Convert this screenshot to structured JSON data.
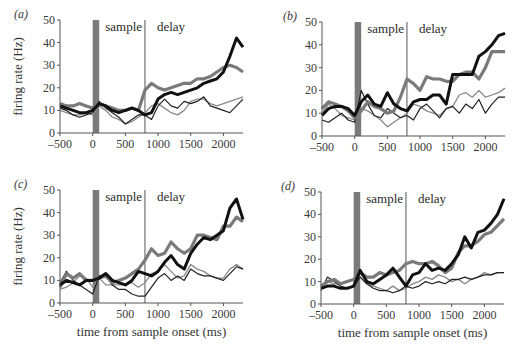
{
  "figure": {
    "ylabel": "firing rate (Hz)",
    "xlabel": "time from sample onset (ms)",
    "sample_label": "sample",
    "delay_label": "delay",
    "colors": {
      "thick_black": "#111111",
      "thick_gray": "#7a7a7a",
      "thin_black": "#222222",
      "thin_gray": "#8a8a8a",
      "sample_bar": "#7a7a7a",
      "axis": "#555555"
    }
  },
  "chart_data": [
    {
      "type": "line",
      "panel": "(a)",
      "title": "",
      "xlabel": "",
      "ylabel": "firing rate (Hz)",
      "xlim": [
        -500,
        2300
      ],
      "ylim": [
        0,
        50
      ],
      "xticks": [
        -500,
        0,
        500,
        1000,
        1500,
        2000
      ],
      "yticks": [
        0,
        10,
        20,
        30,
        40,
        50
      ],
      "grid": false,
      "annotations": [
        {
          "text": "sample",
          "type": "shaded_bar",
          "x": [
            0,
            100
          ]
        },
        {
          "text": "delay",
          "type": "vline",
          "x": 800
        }
      ],
      "x": [
        -500,
        -400,
        -300,
        -200,
        -100,
        0,
        100,
        200,
        300,
        400,
        500,
        600,
        700,
        800,
        900,
        1000,
        1100,
        1200,
        1300,
        1400,
        1500,
        1600,
        1700,
        1800,
        1900,
        2000,
        2100,
        2200,
        2300
      ],
      "series": [
        {
          "name": "thick black",
          "values": [
            12,
            11,
            10,
            9,
            9,
            10,
            13,
            12,
            10,
            9,
            10,
            11,
            10,
            8,
            9,
            15,
            17,
            18,
            17,
            18,
            19,
            20,
            22,
            23,
            24,
            27,
            34,
            42,
            38
          ]
        },
        {
          "name": "thick gray",
          "values": [
            13,
            12,
            12,
            13,
            12,
            11,
            13,
            12,
            11,
            10,
            10,
            11,
            10,
            19,
            22,
            20,
            19,
            20,
            21,
            22,
            22,
            24,
            24,
            25,
            27,
            29,
            30,
            29,
            27
          ]
        },
        {
          "name": "thin black",
          "values": [
            11,
            10,
            8,
            7,
            8,
            9,
            14,
            11,
            9,
            7,
            4,
            6,
            8,
            8,
            6,
            12,
            15,
            12,
            11,
            14,
            13,
            14,
            16,
            12,
            11,
            10,
            9,
            12,
            15
          ]
        },
        {
          "name": "thin gray",
          "values": [
            10,
            9,
            8,
            8,
            9,
            8,
            12,
            10,
            7,
            6,
            4,
            5,
            7,
            9,
            12,
            13,
            11,
            9,
            8,
            10,
            14,
            15,
            15,
            13,
            12,
            13,
            14,
            15,
            16
          ]
        }
      ]
    },
    {
      "type": "line",
      "panel": "(b)",
      "title": "",
      "xlabel": "",
      "ylabel": "",
      "xlim": [
        -500,
        2300
      ],
      "ylim": [
        0,
        50
      ],
      "xticks": [
        -500,
        0,
        500,
        1000,
        1500,
        2000
      ],
      "yticks": [
        0,
        10,
        20,
        30,
        40,
        50
      ],
      "grid": false,
      "annotations": [
        {
          "text": "sample",
          "type": "shaded_bar",
          "x": [
            0,
            100
          ]
        },
        {
          "text": "delay",
          "type": "vline",
          "x": 800
        }
      ],
      "x": [
        -500,
        -400,
        -300,
        -200,
        -100,
        0,
        100,
        200,
        300,
        400,
        500,
        600,
        700,
        800,
        900,
        1000,
        1100,
        1200,
        1300,
        1400,
        1500,
        1600,
        1700,
        1800,
        1900,
        2000,
        2100,
        2200,
        2300
      ],
      "series": [
        {
          "name": "thick black",
          "values": [
            9,
            12,
            13,
            13,
            12,
            9,
            15,
            18,
            14,
            13,
            19,
            14,
            12,
            11,
            15,
            16,
            16,
            18,
            18,
            14,
            27,
            27,
            27,
            27,
            35,
            37,
            40,
            44,
            45
          ]
        },
        {
          "name": "thick gray",
          "values": [
            12,
            15,
            14,
            13,
            11,
            8,
            11,
            15,
            13,
            12,
            10,
            11,
            17,
            25,
            23,
            20,
            26,
            25,
            25,
            24,
            24,
            27,
            28,
            28,
            25,
            30,
            37,
            37,
            37
          ]
        },
        {
          "name": "thin black",
          "values": [
            7,
            6,
            8,
            10,
            7,
            6,
            20,
            14,
            9,
            8,
            12,
            10,
            8,
            9,
            7,
            12,
            14,
            11,
            8,
            12,
            13,
            10,
            14,
            12,
            16,
            10,
            14,
            17,
            17
          ]
        },
        {
          "name": "thin gray",
          "values": [
            10,
            14,
            12,
            9,
            8,
            7,
            12,
            11,
            9,
            7,
            4,
            6,
            8,
            10,
            14,
            13,
            11,
            10,
            9,
            12,
            13,
            18,
            19,
            17,
            20,
            17,
            18,
            19,
            21
          ]
        }
      ]
    },
    {
      "type": "line",
      "panel": "(c)",
      "title": "",
      "xlabel": "time from sample onset (ms)",
      "ylabel": "firing rate (Hz)",
      "xlim": [
        -500,
        2300
      ],
      "ylim": [
        0,
        50
      ],
      "xticks": [
        -500,
        0,
        500,
        1000,
        1500,
        2000
      ],
      "yticks": [
        0,
        10,
        20,
        30,
        40,
        50
      ],
      "grid": false,
      "annotations": [
        {
          "text": "sample",
          "type": "shaded_bar",
          "x": [
            0,
            100
          ]
        },
        {
          "text": "delay",
          "type": "vline",
          "x": 800
        }
      ],
      "x": [
        -500,
        -400,
        -300,
        -200,
        -100,
        0,
        100,
        200,
        300,
        400,
        500,
        600,
        700,
        800,
        900,
        1000,
        1100,
        1200,
        1300,
        1400,
        1500,
        1600,
        1700,
        1800,
        1900,
        2000,
        2100,
        2200,
        2300
      ],
      "series": [
        {
          "name": "thick black",
          "values": [
            8,
            10,
            9,
            8,
            10,
            10,
            11,
            13,
            10,
            9,
            8,
            10,
            14,
            13,
            12,
            14,
            18,
            21,
            17,
            15,
            22,
            26,
            29,
            28,
            30,
            32,
            42,
            46,
            37
          ]
        },
        {
          "name": "thick gray",
          "values": [
            7,
            13,
            11,
            13,
            10,
            10,
            11,
            12,
            9,
            10,
            11,
            13,
            15,
            19,
            24,
            21,
            22,
            27,
            24,
            22,
            24,
            30,
            30,
            29,
            28,
            34,
            34,
            38,
            36
          ]
        },
        {
          "name": "thin black",
          "values": [
            9,
            14,
            10,
            8,
            6,
            4,
            12,
            12,
            8,
            6,
            6,
            4,
            3,
            3,
            7,
            11,
            13,
            10,
            12,
            10,
            15,
            13,
            12,
            12,
            11,
            10,
            13,
            16,
            15
          ]
        },
        {
          "name": "thin gray",
          "values": [
            6,
            7,
            9,
            12,
            11,
            7,
            11,
            8,
            8,
            8,
            8,
            9,
            7,
            9,
            13,
            14,
            17,
            14,
            11,
            12,
            17,
            15,
            14,
            12,
            11,
            11,
            15,
            17,
            15
          ]
        }
      ]
    },
    {
      "type": "line",
      "panel": "(d)",
      "title": "",
      "xlabel": "time from sample onset (ms)",
      "ylabel": "",
      "xlim": [
        -500,
        2300
      ],
      "ylim": [
        0,
        50
      ],
      "xticks": [
        -500,
        0,
        500,
        1000,
        1500,
        2000
      ],
      "yticks": [
        0,
        10,
        20,
        30,
        40,
        50
      ],
      "grid": false,
      "annotations": [
        {
          "text": "sample",
          "type": "shaded_bar",
          "x": [
            0,
            100
          ]
        },
        {
          "text": "delay",
          "type": "vline",
          "x": 800
        }
      ],
      "x": [
        -500,
        -400,
        -300,
        -200,
        -100,
        0,
        100,
        200,
        300,
        400,
        500,
        600,
        700,
        800,
        900,
        1000,
        1100,
        1200,
        1300,
        1400,
        1500,
        1600,
        1700,
        1800,
        1900,
        2000,
        2100,
        2200,
        2300
      ],
      "series": [
        {
          "name": "thick black",
          "values": [
            7,
            8,
            8,
            7,
            7,
            8,
            15,
            10,
            9,
            11,
            13,
            16,
            12,
            8,
            13,
            14,
            18,
            15,
            16,
            15,
            18,
            22,
            30,
            25,
            32,
            33,
            36,
            40,
            47
          ]
        },
        {
          "name": "thick gray",
          "values": [
            8,
            10,
            11,
            9,
            10,
            11,
            14,
            12,
            12,
            14,
            13,
            14,
            15,
            18,
            19,
            18,
            18,
            19,
            17,
            14,
            16,
            23,
            26,
            26,
            28,
            31,
            32,
            35,
            38
          ]
        },
        {
          "name": "thin black",
          "values": [
            6,
            12,
            10,
            8,
            7,
            8,
            12,
            9,
            7,
            6,
            6,
            5,
            6,
            8,
            7,
            8,
            10,
            9,
            10,
            9,
            11,
            11,
            12,
            11,
            12,
            13,
            13,
            14,
            14
          ]
        },
        {
          "name": "thin gray",
          "values": [
            7,
            10,
            9,
            9,
            10,
            11,
            12,
            9,
            8,
            7,
            6,
            8,
            6,
            7,
            9,
            10,
            12,
            11,
            13,
            12,
            10,
            11,
            9,
            11,
            12,
            14,
            13,
            14,
            14
          ]
        }
      ]
    }
  ],
  "panels_layout": [
    {
      "id": "a",
      "x0": 60,
      "x1": 243,
      "ytop": 20,
      "ybot": 133,
      "label_x": 14,
      "label_y": 18,
      "has_ylabel": true,
      "has_xlabel": false
    },
    {
      "id": "b",
      "x0": 322,
      "x1": 505,
      "ytop": 22,
      "ybot": 136,
      "label_x": 283,
      "label_y": 20,
      "has_ylabel": false,
      "has_xlabel": false
    },
    {
      "id": "c",
      "x0": 60,
      "x1": 243,
      "ytop": 190,
      "ybot": 303,
      "label_x": 14,
      "label_y": 188,
      "has_ylabel": true,
      "has_xlabel": true
    },
    {
      "id": "d",
      "x0": 321,
      "x1": 504,
      "ytop": 192,
      "ybot": 304,
      "label_x": 281,
      "label_y": 190,
      "has_ylabel": false,
      "has_xlabel": true
    }
  ]
}
